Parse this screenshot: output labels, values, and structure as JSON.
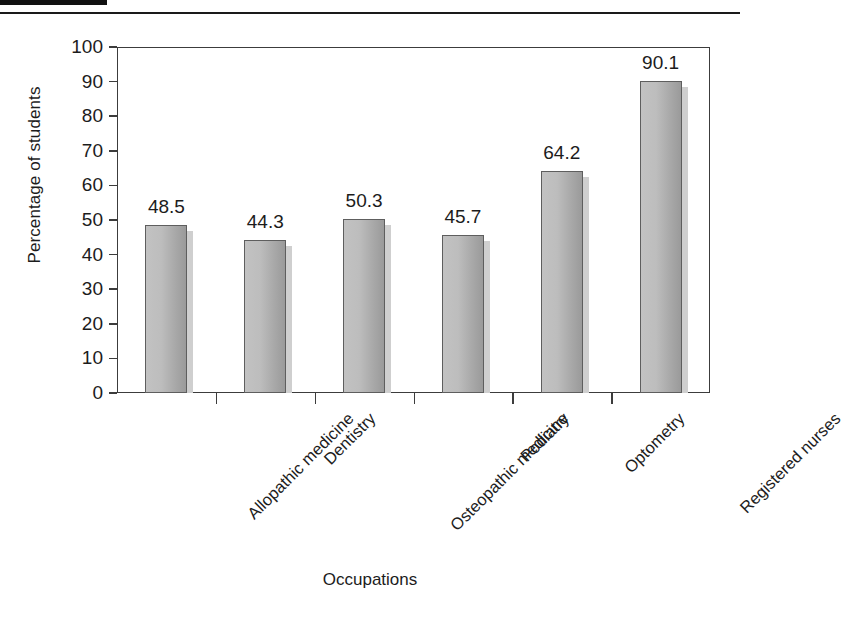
{
  "figure": {
    "background_color": "#ffffff",
    "frame_color": "#3c3c3c",
    "bar_fill_light": "#c2c2c2",
    "bar_fill_dark": "#9a9a9a",
    "bar_edge_color": "#5e5e5e",
    "bar_shadow_color": "#cfcfcf",
    "text_color": "#1c1c1c",
    "header_tab_color": "#111111"
  },
  "chart_data": {
    "type": "bar",
    "title": "",
    "xlabel": "Occupations",
    "ylabel": "Percentage of students",
    "categories": [
      "Allopathic medicine",
      "Dentistry",
      "Osteopathic medicine",
      "Podiatry",
      "Optometry",
      "Registered nurses"
    ],
    "values": [
      48.5,
      44.3,
      50.3,
      45.7,
      64.2,
      90.1
    ],
    "value_labels": [
      "48.5",
      "44.3",
      "50.3",
      "45.7",
      "64.2",
      "90.1"
    ],
    "ylim": [
      0,
      100
    ],
    "yticks": [
      0,
      10,
      20,
      30,
      40,
      50,
      60,
      70,
      80,
      90,
      100
    ],
    "ytick_labels": [
      "0",
      "10",
      "20",
      "30",
      "40",
      "50",
      "60",
      "70",
      "80",
      "90",
      "100"
    ],
    "grid": false,
    "legend": null,
    "xtick_label_rotation": -45
  }
}
